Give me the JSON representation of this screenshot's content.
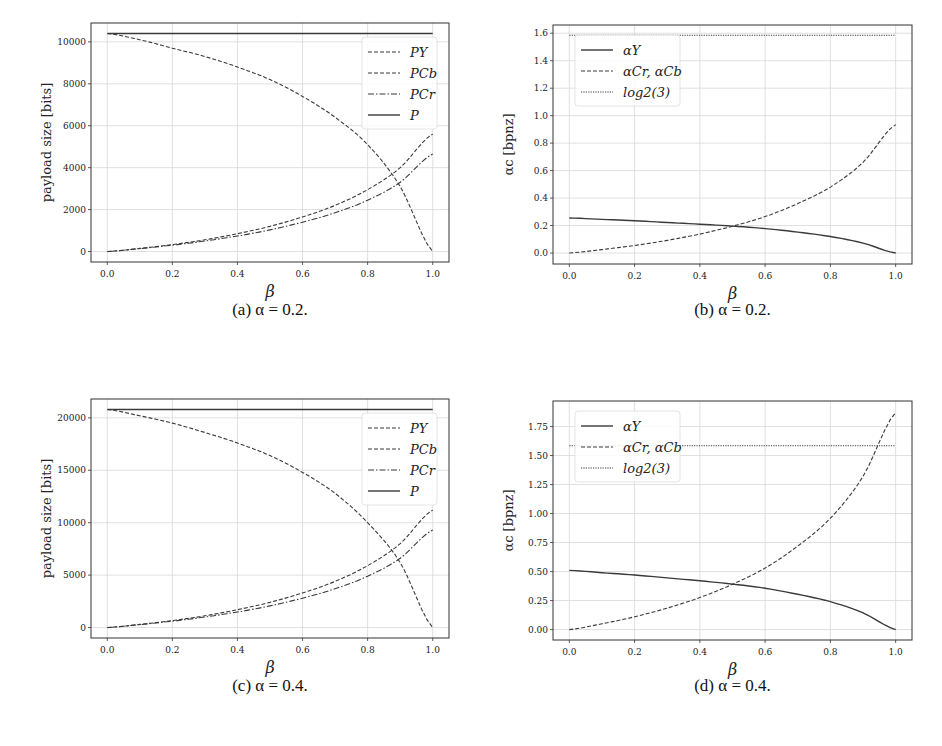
{
  "chart_data": [
    {
      "id": "a",
      "type": "line",
      "caption": "(a) α = 0.2.",
      "xlabel": "β",
      "ylabel": "payload size [bits]",
      "xlim": [
        -0.05,
        1.05
      ],
      "ylim": [
        -500,
        10900
      ],
      "xticks": [
        0.0,
        0.2,
        0.4,
        0.6,
        0.8,
        1.0
      ],
      "xtick_labels": [
        "0.0",
        "0.2",
        "0.4",
        "0.6",
        "0.8",
        "1.0"
      ],
      "yticks": [
        0,
        2000,
        4000,
        6000,
        8000,
        10000
      ],
      "ytick_labels": [
        "0",
        "2000",
        "4000",
        "6000",
        "8000",
        "10000"
      ],
      "grid": true,
      "legend_position": "upper right",
      "x": [
        0.0,
        0.1,
        0.2,
        0.3,
        0.4,
        0.5,
        0.6,
        0.7,
        0.8,
        0.9,
        1.0
      ],
      "series": [
        {
          "name": "P_Y",
          "label": "PY",
          "style": "dashed",
          "values": [
            10400,
            10100,
            9700,
            9300,
            8800,
            8200,
            7400,
            6400,
            5100,
            3100,
            0
          ]
        },
        {
          "name": "P_Cb",
          "label": "PCb",
          "style": "dashed",
          "values": [
            0,
            150,
            330,
            560,
            850,
            1200,
            1650,
            2200,
            2950,
            4000,
            5600
          ]
        },
        {
          "name": "P_Cr",
          "label": "PCr",
          "style": "dashdot",
          "values": [
            0,
            140,
            300,
            500,
            740,
            1030,
            1400,
            1850,
            2450,
            3300,
            4650
          ]
        },
        {
          "name": "P",
          "label": "P",
          "style": "solid",
          "values": [
            10400,
            10400,
            10400,
            10400,
            10400,
            10400,
            10400,
            10400,
            10400,
            10400,
            10400
          ]
        }
      ]
    },
    {
      "id": "b",
      "type": "line",
      "caption": "(b) α = 0.2.",
      "xlabel": "β",
      "ylabel": "αc [bpnz]",
      "xlim": [
        -0.05,
        1.05
      ],
      "ylim": [
        -0.08,
        1.66
      ],
      "xticks": [
        0.0,
        0.2,
        0.4,
        0.6,
        0.8,
        1.0
      ],
      "xtick_labels": [
        "0.0",
        "0.2",
        "0.4",
        "0.6",
        "0.8",
        "1.0"
      ],
      "yticks": [
        0.0,
        0.2,
        0.4,
        0.6,
        0.8,
        1.0,
        1.2,
        1.4,
        1.6
      ],
      "ytick_labels": [
        "0.0",
        "0.2",
        "0.4",
        "0.6",
        "0.8",
        "1.0",
        "1.2",
        "1.4",
        "1.6"
      ],
      "grid": true,
      "legend_position": "upper left",
      "x": [
        0.0,
        0.1,
        0.2,
        0.3,
        0.4,
        0.5,
        0.6,
        0.7,
        0.8,
        0.9,
        1.0
      ],
      "series": [
        {
          "name": "alpha_Y",
          "label": "αY",
          "style": "solid",
          "values": [
            0.255,
            0.245,
            0.235,
            0.222,
            0.21,
            0.196,
            0.178,
            0.152,
            0.12,
            0.072,
            0.0
          ]
        },
        {
          "name": "alpha_Cr, alpha_Cb",
          "label": "αCr, αCb",
          "style": "dashed",
          "values": [
            0.0,
            0.025,
            0.055,
            0.092,
            0.138,
            0.195,
            0.265,
            0.36,
            0.48,
            0.66,
            0.935
          ]
        },
        {
          "name": "log2(3)",
          "label": "log2(3)",
          "style": "dotted",
          "values": [
            1.585,
            1.585,
            1.585,
            1.585,
            1.585,
            1.585,
            1.585,
            1.585,
            1.585,
            1.585,
            1.585
          ]
        }
      ]
    },
    {
      "id": "c",
      "type": "line",
      "caption": "(c) α = 0.4.",
      "xlabel": "β",
      "ylabel": "payload size [bits]",
      "xlim": [
        -0.05,
        1.05
      ],
      "ylim": [
        -1000,
        21800
      ],
      "xticks": [
        0.0,
        0.2,
        0.4,
        0.6,
        0.8,
        1.0
      ],
      "xtick_labels": [
        "0.0",
        "0.2",
        "0.4",
        "0.6",
        "0.8",
        "1.0"
      ],
      "yticks": [
        0,
        5000,
        10000,
        15000,
        20000
      ],
      "ytick_labels": [
        "0",
        "5000",
        "10000",
        "15000",
        "20000"
      ],
      "grid": true,
      "legend_position": "upper right",
      "x": [
        0.0,
        0.1,
        0.2,
        0.3,
        0.4,
        0.5,
        0.6,
        0.7,
        0.8,
        0.9,
        1.0
      ],
      "series": [
        {
          "name": "P_Y",
          "label": "PY",
          "style": "dashed",
          "values": [
            20800,
            20200,
            19500,
            18600,
            17600,
            16400,
            14800,
            12800,
            10000,
            6200,
            0
          ]
        },
        {
          "name": "P_Cb",
          "label": "PCb",
          "style": "dashed",
          "values": [
            0,
            300,
            660,
            1120,
            1700,
            2400,
            3300,
            4400,
            5900,
            8000,
            11200
          ]
        },
        {
          "name": "P_Cr",
          "label": "PCr",
          "style": "dashdot",
          "values": [
            0,
            280,
            600,
            1000,
            1480,
            2060,
            2800,
            3700,
            4900,
            6600,
            9300
          ]
        },
        {
          "name": "P",
          "label": "P",
          "style": "solid",
          "values": [
            20800,
            20800,
            20800,
            20800,
            20800,
            20800,
            20800,
            20800,
            20800,
            20800,
            20800
          ]
        }
      ]
    },
    {
      "id": "d",
      "type": "line",
      "caption": "(d) α = 0.4.",
      "xlabel": "β",
      "ylabel": "αc [bpnz]",
      "xlim": [
        -0.05,
        1.05
      ],
      "ylim": [
        -0.09,
        1.97
      ],
      "xticks": [
        0.0,
        0.2,
        0.4,
        0.6,
        0.8,
        1.0
      ],
      "xtick_labels": [
        "0.0",
        "0.2",
        "0.4",
        "0.6",
        "0.8",
        "1.0"
      ],
      "yticks": [
        0.0,
        0.25,
        0.5,
        0.75,
        1.0,
        1.25,
        1.5,
        1.75
      ],
      "ytick_labels": [
        "0.00",
        "0.25",
        "0.50",
        "0.75",
        "1.00",
        "1.25",
        "1.50",
        "1.75"
      ],
      "grid": true,
      "legend_position": "upper left",
      "x": [
        0.0,
        0.1,
        0.2,
        0.3,
        0.4,
        0.5,
        0.6,
        0.7,
        0.8,
        0.9,
        1.0
      ],
      "series": [
        {
          "name": "alpha_Y",
          "label": "αY",
          "style": "solid",
          "values": [
            0.51,
            0.49,
            0.47,
            0.445,
            0.42,
            0.392,
            0.356,
            0.304,
            0.24,
            0.144,
            0.0
          ]
        },
        {
          "name": "alpha_Cr, alpha_Cb",
          "label": "αCr, αCb",
          "style": "dashed",
          "values": [
            0.0,
            0.05,
            0.11,
            0.185,
            0.276,
            0.39,
            0.53,
            0.72,
            0.96,
            1.32,
            1.87
          ]
        },
        {
          "name": "log2(3)",
          "label": "log2(3)",
          "style": "dotted",
          "values": [
            1.585,
            1.585,
            1.585,
            1.585,
            1.585,
            1.585,
            1.585,
            1.585,
            1.585,
            1.585,
            1.585
          ]
        }
      ]
    }
  ],
  "layout": [
    {
      "frame": [
        91,
        23,
        449,
        262
      ],
      "caption_y": 312
    },
    {
      "frame": [
        553,
        25,
        912,
        264
      ],
      "caption_y": 312
    },
    {
      "frame": [
        91,
        399,
        449,
        638
      ],
      "caption_y": 688
    },
    {
      "frame": [
        553,
        401,
        912,
        640
      ],
      "caption_y": 688
    }
  ],
  "colors": {
    "line": "#3a3a3a",
    "grid": "#d8d8d8",
    "frame": "#333333",
    "text": "#222222"
  }
}
